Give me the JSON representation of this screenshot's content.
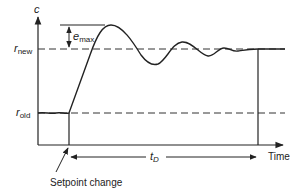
{
  "diagram": {
    "type": "setpoint step response",
    "y_axis_label": "c",
    "x_axis_label": "Time",
    "levels": {
      "r_new": {
        "base": "r",
        "sub": "new"
      },
      "r_old": {
        "base": "r",
        "sub": "old"
      }
    },
    "overshoot": {
      "base": "e",
      "sub": "max"
    },
    "settling": {
      "base": "t",
      "sub": "D"
    },
    "event_label": "Setpoint change",
    "colors": {
      "line": "#222222",
      "background": "#ffffff"
    }
  }
}
